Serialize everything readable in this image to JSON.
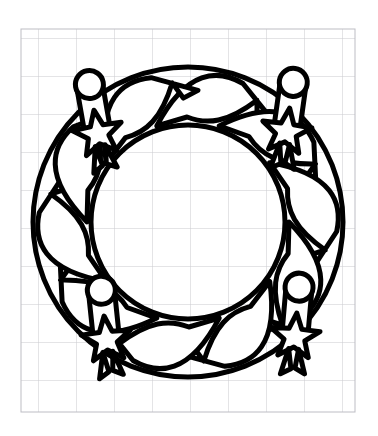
{
  "page": {
    "width": 378,
    "height": 436,
    "background_color": "#ffffff"
  },
  "grid": {
    "label": "graph-paper-grid",
    "line_color": "#c9c9ce",
    "border_color": "#bdbdc4",
    "cell_size": 38,
    "origin_x": 21,
    "origin_y": 29,
    "width": 334,
    "height": 383,
    "columns": 9,
    "rows": 10,
    "visible": true
  },
  "artwork": {
    "name": "advent-wreath",
    "style": "black-outline-line-art",
    "stroke_color": "#000000",
    "fill_color": "#ffffff",
    "stroke_width": 5,
    "center_x": 188,
    "center_y": 222,
    "outer_radius": 155,
    "inner_radius": 97,
    "description": "Circular evergreen wreath drawn as overlapping twisted leaf fronds with four candles standing upright around the ring.",
    "leaf_count": 10,
    "candle_count": 4
  },
  "candles": [
    {
      "name": "candle-top-left",
      "position_label": "top-left",
      "angle_degrees": 225,
      "center_x": 96,
      "center_y": 122,
      "flame_cx": 96,
      "flame_cy": 84,
      "flame_r": 14,
      "body_width": 26,
      "body_height": 48,
      "tilt_degrees": -10,
      "bow_label": "star-bow-decoration"
    },
    {
      "name": "candle-top-right",
      "position_label": "top-right",
      "angle_degrees": 315,
      "center_x": 288,
      "center_y": 120,
      "flame_cx": 288,
      "flame_cy": 82,
      "flame_r": 14,
      "body_width": 26,
      "body_height": 48,
      "tilt_degrees": 8,
      "bow_label": "star-bow-decoration"
    },
    {
      "name": "candle-bottom-left",
      "position_label": "bottom-left",
      "angle_degrees": 135,
      "center_x": 105,
      "center_y": 325,
      "flame_cx": 105,
      "flame_cy": 290,
      "flame_r": 14,
      "body_width": 26,
      "body_height": 48,
      "tilt_degrees": -6,
      "bow_label": "star-bow-decoration"
    },
    {
      "name": "candle-bottom-right",
      "position_label": "bottom-right",
      "angle_degrees": 45,
      "center_x": 296,
      "center_y": 322,
      "flame_cx": 296,
      "flame_cy": 287,
      "flame_r": 14,
      "body_width": 26,
      "body_height": 48,
      "tilt_degrees": 5,
      "bow_label": "star-bow-decoration"
    }
  ]
}
